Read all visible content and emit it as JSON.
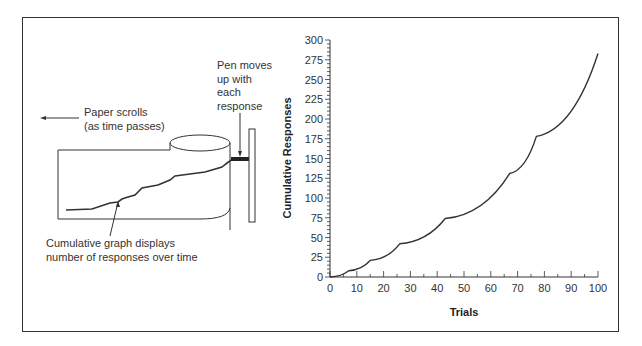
{
  "diagram": {
    "labels": {
      "paper_scrolls_line1": "Paper scrolls",
      "paper_scrolls_line2": "(as time passes)",
      "pen_line1": "Pen moves",
      "pen_line2": "up with",
      "pen_line3": "each",
      "pen_line4": "response",
      "graph_line1": "Cumulative graph displays",
      "graph_line2": "number of responses over time"
    }
  },
  "chart_data": {
    "type": "line",
    "title": "",
    "xlabel": "Trials",
    "ylabel": "Cumulative Responses",
    "xlim": [
      0,
      100
    ],
    "ylim": [
      0,
      300
    ],
    "x_ticks": [
      "0",
      "10",
      "20",
      "30",
      "40",
      "50",
      "60",
      "70",
      "80",
      "90",
      "100"
    ],
    "y_ticks": [
      "0",
      "25",
      "50",
      "75",
      "100",
      "125",
      "150",
      "175",
      "200",
      "225",
      "250",
      "275",
      "300"
    ],
    "grid": false,
    "legend": null,
    "series": [
      {
        "name": "Cumulative Responses",
        "description": "Scalloped (fixed-interval style) cumulative record; accelerating segments ending in cusps",
        "points": [
          {
            "x": 0,
            "y": 0
          },
          {
            "x": 7,
            "y": 8
          },
          {
            "x": 15,
            "y": 21
          },
          {
            "x": 26,
            "y": 42
          },
          {
            "x": 43,
            "y": 74
          },
          {
            "x": 67,
            "y": 131
          },
          {
            "x": 77,
            "y": 178
          },
          {
            "x": 100,
            "y": 283
          }
        ]
      }
    ]
  }
}
